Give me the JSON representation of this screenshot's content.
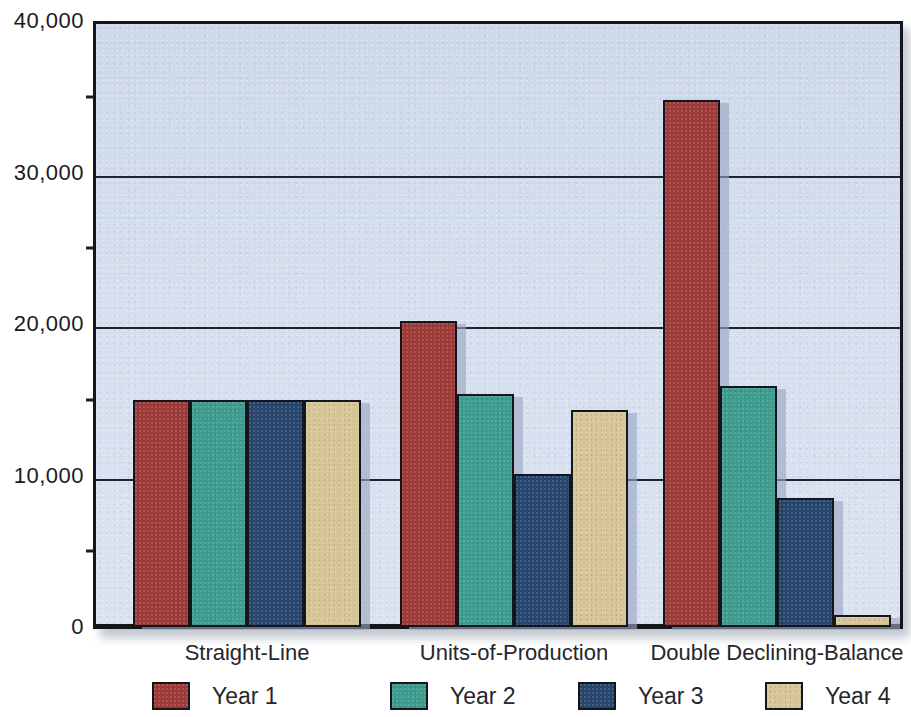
{
  "chart_data": {
    "type": "bar",
    "title": "",
    "xlabel": "",
    "ylabel": "",
    "ylim": [
      0,
      40000
    ],
    "grid": true,
    "legend_position": "bottom",
    "categories": [
      "Straight-Line",
      "Units-of-Production",
      "Double Declining-Balance"
    ],
    "ytick_labels": [
      "0",
      "10,000",
      "20,000",
      "30,000",
      "40,000"
    ],
    "ytick_values": [
      0,
      10000,
      20000,
      30000,
      40000
    ],
    "yminor_tick_values": [
      5000,
      15000,
      25000,
      35000
    ],
    "series": [
      {
        "name": "Year 1",
        "color": "#9e3b38",
        "values": [
          15000,
          20200,
          34800
        ]
      },
      {
        "name": "Year 2",
        "color": "#3d9b8f",
        "values": [
          15000,
          15400,
          15900
        ]
      },
      {
        "name": "Year 3",
        "color": "#27466e",
        "values": [
          15000,
          10100,
          8500
        ]
      },
      {
        "name": "Year 4",
        "color": "#d6c596",
        "values": [
          15000,
          14300,
          800
        ]
      }
    ]
  },
  "colors": {
    "plot_background": "#d5dfee",
    "axis_line": "#15161c",
    "gridline": "#20222c",
    "page_background": "#ffffff",
    "bar_shadow": "#9aa6c4"
  },
  "legend": {
    "items": [
      {
        "label": "Year 1",
        "color": "#9e3b38"
      },
      {
        "label": "Year 2",
        "color": "#3d9b8f"
      },
      {
        "label": "Year 3",
        "color": "#27466e"
      },
      {
        "label": "Year 4",
        "color": "#d6c596"
      }
    ]
  }
}
